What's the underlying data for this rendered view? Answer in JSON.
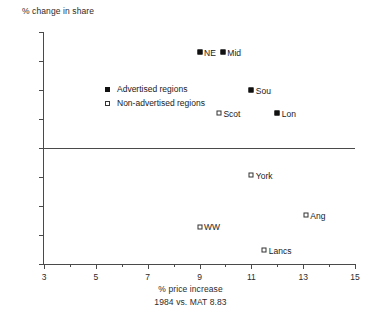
{
  "chart_data": {
    "type": "scatter",
    "title": "",
    "ylabel": "% change in share",
    "xlabel": "% price increase",
    "xsublabel": "1984 vs. MAT 8.83",
    "xlim": [
      3,
      15
    ],
    "ylim": [
      -20,
      20
    ],
    "grid": false,
    "zero_line": true,
    "legend_position": "upper-left-inside",
    "x_ticks_major": [
      3,
      5,
      7,
      9,
      11,
      13,
      15
    ],
    "x_ticks_minor": [
      4,
      6,
      8,
      10,
      12,
      14
    ],
    "x_tick_labels": [
      "3",
      "5",
      "7",
      "9",
      "11",
      "13",
      "15"
    ],
    "y_ticks": [
      -20,
      -15,
      -10,
      -5,
      0,
      5,
      10,
      15,
      20
    ],
    "y_tick_labels": [
      "-20",
      "-15",
      "-10",
      "-5",
      "0",
      "5",
      "10",
      "15",
      "20"
    ],
    "series": [
      {
        "name": "Advertised regions",
        "marker": "filled-square",
        "points": [
          {
            "label": "NE",
            "x": 9.0,
            "y": 16.5
          },
          {
            "label": "Mid",
            "x": 9.9,
            "y": 16.5
          },
          {
            "label": "Sou",
            "x": 11.0,
            "y": 10.0
          },
          {
            "label": "Lon",
            "x": 12.0,
            "y": 6.0
          }
        ]
      },
      {
        "name": "Non-advertised regions",
        "marker": "open-square",
        "points": [
          {
            "label": "Scot",
            "x": 9.75,
            "y": 6.0
          },
          {
            "label": "York",
            "x": 11.0,
            "y": -4.7
          },
          {
            "label": "Ang",
            "x": 13.1,
            "y": -11.6
          },
          {
            "label": "WW",
            "x": 9.0,
            "y": -13.6
          },
          {
            "label": "Lancs",
            "x": 11.5,
            "y": -17.6
          }
        ]
      }
    ]
  },
  "legend": {
    "items": [
      {
        "label": "Advertised regions",
        "marker": "filled-square"
      },
      {
        "label": "Non-advertised regions",
        "marker": "open-square"
      }
    ]
  }
}
